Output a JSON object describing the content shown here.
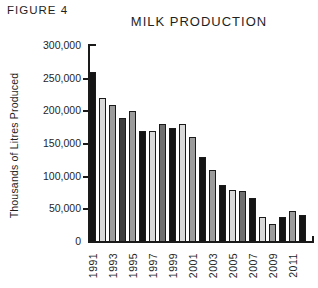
{
  "figure_label": "FIGURE 4",
  "chart_data": {
    "type": "bar",
    "title": "MILK PRODUCTION",
    "ylabel": "Thousands of Litres Produced",
    "xlabel": "",
    "ylim": [
      0,
      300000
    ],
    "ytick_interval": 50000,
    "ytick_labels": [
      "0",
      "50,000",
      "100,000",
      "150,000",
      "200,000",
      "250,000",
      "300,000"
    ],
    "x_tick_labels_shown": [
      "1991",
      "1993",
      "1995",
      "1997",
      "1999",
      "2001",
      "2003",
      "2005",
      "2007",
      "2009",
      "2011"
    ],
    "categories": [
      "1991",
      "1992",
      "1993",
      "1994",
      "1995",
      "1996",
      "1997",
      "1998",
      "1999",
      "2000",
      "2001",
      "2002",
      "2003",
      "2004",
      "2005",
      "2006",
      "2007",
      "2008",
      "2009",
      "2010",
      "2011",
      "2012"
    ],
    "values": [
      260000,
      220000,
      210000,
      190000,
      200000,
      170000,
      170000,
      180000,
      175000,
      180000,
      160000,
      130000,
      110000,
      88000,
      79000,
      78000,
      68000,
      38000,
      28000,
      38000,
      47000,
      42000
    ],
    "bar_shades": [
      "black",
      "light",
      "mid",
      "dark",
      "mid",
      "black",
      "light",
      "middark",
      "black",
      "light",
      "mid",
      "black",
      "mid",
      "black",
      "light",
      "middark",
      "black",
      "light",
      "mid",
      "black",
      "mid",
      "black"
    ],
    "palette": {
      "black": "#141414",
      "light": "#d9d9d9",
      "mid": "#9b9b9b",
      "middark": "#6f6f6f",
      "dark": "#3c3c3c"
    },
    "axis_color": "#1a1a1a",
    "grid": false,
    "legend": "none"
  }
}
